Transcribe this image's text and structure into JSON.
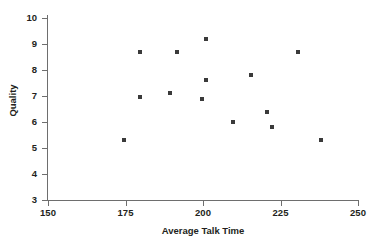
{
  "chart_data": {
    "type": "scatter",
    "title": "",
    "xlabel": "Average Talk Time",
    "ylabel": "Quality",
    "xlim": [
      150,
      250
    ],
    "ylim": [
      3,
      10
    ],
    "xticks": [
      150,
      175,
      200,
      225,
      250
    ],
    "yticks": [
      3,
      4,
      5,
      6,
      7,
      8,
      9,
      10
    ],
    "grid": false,
    "legend": null,
    "marker": {
      "shape": "square",
      "color": "#3a3a3a",
      "size": 4
    },
    "points": [
      {
        "x": 174.5,
        "y": 5.3
      },
      {
        "x": 179.7,
        "y": 8.7
      },
      {
        "x": 179.7,
        "y": 6.95
      },
      {
        "x": 189.4,
        "y": 7.1
      },
      {
        "x": 191.6,
        "y": 8.7
      },
      {
        "x": 199.7,
        "y": 6.9
      },
      {
        "x": 201.0,
        "y": 9.2
      },
      {
        "x": 201.0,
        "y": 7.6
      },
      {
        "x": 209.7,
        "y": 6.0
      },
      {
        "x": 215.5,
        "y": 7.8
      },
      {
        "x": 220.6,
        "y": 6.4
      },
      {
        "x": 222.3,
        "y": 5.8
      },
      {
        "x": 230.6,
        "y": 8.7
      },
      {
        "x": 238.1,
        "y": 5.3
      }
    ]
  },
  "axis": {
    "x_title": "Average Talk Time",
    "y_title": "Quality",
    "x_tick_labels": [
      "150",
      "175",
      "200",
      "225",
      "250"
    ],
    "y_tick_labels": [
      "3",
      "4",
      "5",
      "6",
      "7",
      "8",
      "9",
      "10"
    ]
  },
  "colors": {
    "marker": "#3a3a3a",
    "axis": "#6e6e6e",
    "text": "#231f20",
    "background": "#ffffff"
  }
}
